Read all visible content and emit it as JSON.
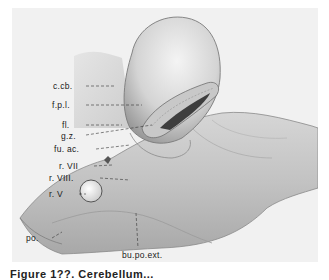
{
  "figure": {
    "labels": [
      {
        "id": "c-cb",
        "text": "c.cb.",
        "x": 53,
        "y": 82
      },
      {
        "id": "f-p-l",
        "text": "f.p.l.",
        "x": 52,
        "y": 101
      },
      {
        "id": "fl",
        "text": "fl.",
        "x": 62,
        "y": 121
      },
      {
        "id": "g-z",
        "text": "g.z.",
        "x": 61,
        "y": 132
      },
      {
        "id": "fu-ac",
        "text": "fu. ac.",
        "x": 54,
        "y": 145
      },
      {
        "id": "r-VII",
        "text": "r. VII",
        "x": 59,
        "y": 162
      },
      {
        "id": "r-VIII",
        "text": "r. VIII.",
        "x": 49,
        "y": 174
      },
      {
        "id": "r-V",
        "text": "r. V",
        "x": 49,
        "y": 190
      },
      {
        "id": "po",
        "text": "po.",
        "x": 26,
        "y": 234
      },
      {
        "id": "bu-po-ext",
        "text": "bu.po.ext.",
        "x": 122,
        "y": 251
      }
    ],
    "colors": {
      "background": "#f1f1f1",
      "page": "#ffffff",
      "ink": "#1a1a1a"
    }
  },
  "caption": {
    "text": "Figure 1??. Cerebellum...",
    "note": "caption partially cut off at bottom edge"
  }
}
